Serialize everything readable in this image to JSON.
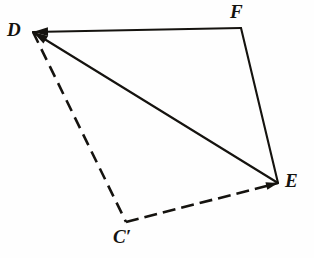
{
  "figure": {
    "kind": "geometry-diagram",
    "canvas": {
      "width": 314,
      "height": 258
    },
    "background_color": "#fefefe",
    "ink_color": "#15130f",
    "vertices": [
      {
        "id": "D",
        "label": "D",
        "x": 33,
        "y": 32,
        "label_x": 7,
        "label_y": 20
      },
      {
        "id": "F",
        "label": "F",
        "x": 241,
        "y": 28,
        "label_x": 230,
        "label_y": 2
      },
      {
        "id": "E",
        "label": "E",
        "x": 278,
        "y": 183,
        "label_x": 285,
        "label_y": 171
      },
      {
        "id": "Cp",
        "label": "C′",
        "x": 126,
        "y": 222,
        "label_x": 113,
        "label_y": 227
      }
    ],
    "edges": [
      {
        "id": "DF",
        "from": "D",
        "to": "F",
        "style": "solid",
        "width": 2.1,
        "arrow_at": "D"
      },
      {
        "id": "FE",
        "from": "F",
        "to": "E",
        "style": "solid",
        "width": 2.1,
        "arrow_at": "none"
      },
      {
        "id": "ED",
        "from": "E",
        "to": "D",
        "style": "solid",
        "width": 2.1,
        "arrow_at": "D"
      },
      {
        "id": "DC",
        "from": "D",
        "to": "Cp",
        "style": "dashed",
        "width": 2.6,
        "dash": "12 7",
        "arrow_at": "none"
      },
      {
        "id": "CE",
        "from": "Cp",
        "to": "E",
        "style": "dashed",
        "width": 2.6,
        "dash": "13 6",
        "arrow_at": "E"
      }
    ]
  }
}
